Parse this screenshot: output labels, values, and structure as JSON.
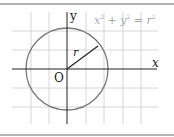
{
  "diagram": {
    "equation": {
      "x": "x",
      "x_exp": "2",
      "plus": "+",
      "y": "y",
      "y_exp": "2",
      "equals": "=",
      "r": "r",
      "r_exp": "2"
    },
    "axis_x_label": "x",
    "axis_y_label": "y",
    "origin_label": "O",
    "radius_label": "r",
    "colors": {
      "grid": "#d4d4d4",
      "axis": "#222222",
      "circle": "#777777",
      "border": "#9a9a9a",
      "equation": "#a8a8a8"
    }
  }
}
